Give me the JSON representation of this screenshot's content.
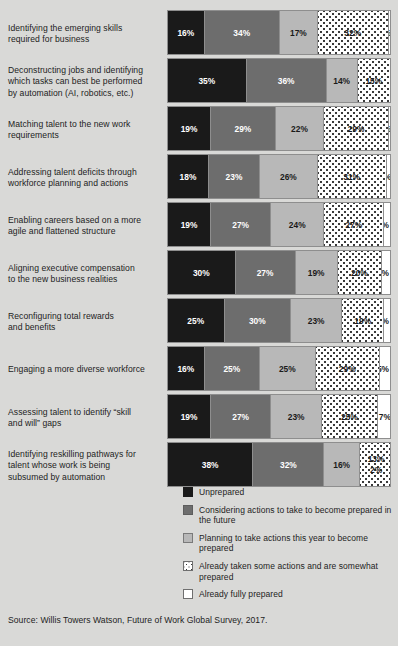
{
  "title": "",
  "source": "Source: Willis Towers Watson, Future of Work Global Survey, 2017.",
  "legend": {
    "items": [
      {
        "key": "unprepared",
        "label": "Unprepared"
      },
      {
        "key": "considering",
        "label": "Considering actions to take to become prepared in the future"
      },
      {
        "key": "planning",
        "label": "Planning to take actions this year to become prepared"
      },
      {
        "key": "taken",
        "label": "Already taken some actions and are somewhat prepared"
      },
      {
        "key": "fully",
        "label": "Already fully prepared"
      }
    ]
  },
  "chart_data": {
    "type": "bar",
    "orientation": "horizontal",
    "stacked": true,
    "unit": "%",
    "xlim": [
      0,
      100
    ],
    "grid": false,
    "legend_position": "bottom-right",
    "title": "",
    "xlabel": "",
    "ylabel": "",
    "series": [
      {
        "name": "Unprepared",
        "key": "unprepared",
        "color": "#1a1a1a",
        "values": [
          16,
          35,
          19,
          18,
          19,
          30,
          25,
          16,
          19,
          38
        ]
      },
      {
        "name": "Considering actions to take to become prepared in the future",
        "key": "considering",
        "color": "#6d6d6d",
        "values": [
          34,
          36,
          29,
          23,
          27,
          27,
          30,
          25,
          27,
          32
        ]
      },
      {
        "name": "Planning to take actions this year to become prepared",
        "key": "planning",
        "color": "#b8b8b8",
        "values": [
          17,
          14,
          22,
          26,
          24,
          19,
          23,
          25,
          23,
          16
        ]
      },
      {
        "name": "Already taken some actions and are somewhat prepared",
        "key": "taken",
        "color": "#ffffff",
        "pattern": "dots",
        "values": [
          32,
          15,
          29,
          31,
          27,
          20,
          19,
          29,
          25,
          13
        ]
      },
      {
        "name": "Already fully prepared",
        "key": "fully",
        "color": "#ffffff",
        "values": [
          2,
          0,
          2,
          3,
          3,
          4,
          3,
          5,
          7,
          2
        ]
      }
    ],
    "categories": [
      "Identifying the emerging skills required for business",
      "Deconstructing jobs and identifying which tasks can best be performed by automation (AI, robotics, etc.)",
      "Matching talent to the new work requirements",
      "Addressing talent deficits through workforce planning and actions",
      "Enabling careers based on a more agile and flattened structure",
      "Aligning executive compensation to the new business realities",
      "Reconfiguring total rewards and benefits",
      "Engaging a more diverse workforce",
      "Assessing talent to identify \"skill and will\" gaps",
      "Identifying reskilling pathways for talent whose work is being subsumed by automation"
    ]
  },
  "rows": [
    {
      "label_lines": [
        "Identifying the emerging skills",
        "required for business"
      ],
      "segments": [
        {
          "key": "unprepared",
          "value": 16,
          "text": "16%"
        },
        {
          "key": "considering",
          "value": 34,
          "text": "34%"
        },
        {
          "key": "planning",
          "value": 17,
          "text": "17%"
        },
        {
          "key": "taken",
          "value": 32,
          "text": "32%"
        },
        {
          "key": "fully",
          "value": 2,
          "text": "2%"
        }
      ]
    },
    {
      "label_lines": [
        "Deconstructing jobs and identifying",
        "which tasks can best be performed",
        "by automation (AI, robotics, etc.)"
      ],
      "segments": [
        {
          "key": "unprepared",
          "value": 35,
          "text": "35%"
        },
        {
          "key": "considering",
          "value": 36,
          "text": "36%"
        },
        {
          "key": "planning",
          "value": 14,
          "text": "14%"
        },
        {
          "key": "taken",
          "value": 15,
          "text": "15%"
        },
        {
          "key": "fully",
          "value": 0,
          "text": ""
        }
      ]
    },
    {
      "label_lines": [
        "Matching talent to the new work",
        "requirements"
      ],
      "segments": [
        {
          "key": "unprepared",
          "value": 19,
          "text": "19%"
        },
        {
          "key": "considering",
          "value": 29,
          "text": "29%"
        },
        {
          "key": "planning",
          "value": 22,
          "text": "22%"
        },
        {
          "key": "taken",
          "value": 29,
          "text": "29%"
        },
        {
          "key": "fully",
          "value": 2,
          "text": "2%"
        }
      ]
    },
    {
      "label_lines": [
        "Addressing talent deficits through",
        "workforce planning and actions"
      ],
      "segments": [
        {
          "key": "unprepared",
          "value": 18,
          "text": "18%"
        },
        {
          "key": "considering",
          "value": 23,
          "text": "23%"
        },
        {
          "key": "planning",
          "value": 26,
          "text": "26%"
        },
        {
          "key": "taken",
          "value": 31,
          "text": "31%"
        },
        {
          "key": "fully",
          "value": 3,
          "text": "3%"
        }
      ]
    },
    {
      "label_lines": [
        "Enabling careers based on a more",
        "agile and flattened structure"
      ],
      "segments": [
        {
          "key": "unprepared",
          "value": 19,
          "text": "19%"
        },
        {
          "key": "considering",
          "value": 27,
          "text": "27%"
        },
        {
          "key": "planning",
          "value": 24,
          "text": "24%"
        },
        {
          "key": "taken",
          "value": 27,
          "text": "27%"
        },
        {
          "key": "fully",
          "value": 3,
          "text": "3%"
        }
      ]
    },
    {
      "label_lines": [
        "Aligning executive compensation",
        "to the new business realities"
      ],
      "segments": [
        {
          "key": "unprepared",
          "value": 30,
          "text": "30%"
        },
        {
          "key": "considering",
          "value": 27,
          "text": "27%"
        },
        {
          "key": "planning",
          "value": 19,
          "text": "19%"
        },
        {
          "key": "taken",
          "value": 20,
          "text": "20%"
        },
        {
          "key": "fully",
          "value": 4,
          "text": "4%"
        }
      ]
    },
    {
      "label_lines": [
        "Reconfiguring total rewards",
        "and benefits"
      ],
      "segments": [
        {
          "key": "unprepared",
          "value": 25,
          "text": "25%"
        },
        {
          "key": "considering",
          "value": 30,
          "text": "30%"
        },
        {
          "key": "planning",
          "value": 23,
          "text": "23%"
        },
        {
          "key": "taken",
          "value": 19,
          "text": "19%"
        },
        {
          "key": "fully",
          "value": 3,
          "text": "3%"
        }
      ]
    },
    {
      "label_lines": [
        "Engaging a more diverse workforce"
      ],
      "segments": [
        {
          "key": "unprepared",
          "value": 16,
          "text": "16%"
        },
        {
          "key": "considering",
          "value": 25,
          "text": "25%"
        },
        {
          "key": "planning",
          "value": 25,
          "text": "25%"
        },
        {
          "key": "taken",
          "value": 29,
          "text": "29%"
        },
        {
          "key": "fully",
          "value": 5,
          "text": "5%"
        }
      ]
    },
    {
      "label_lines": [
        "Assessing talent to identify “skill",
        "and will” gaps"
      ],
      "segments": [
        {
          "key": "unprepared",
          "value": 19,
          "text": "19%"
        },
        {
          "key": "considering",
          "value": 27,
          "text": "27%"
        },
        {
          "key": "planning",
          "value": 23,
          "text": "23%"
        },
        {
          "key": "taken",
          "value": 25,
          "text": "25%"
        },
        {
          "key": "fully",
          "value": 7,
          "text": "7%"
        }
      ]
    },
    {
      "label_lines": [
        "Identifying reskilling pathways for",
        "talent whose work is being",
        "subsumed by automation"
      ],
      "segments": [
        {
          "key": "unprepared",
          "value": 38,
          "text": "38%"
        },
        {
          "key": "considering",
          "value": 32,
          "text": "32%"
        },
        {
          "key": "planning",
          "value": 16,
          "text": "16%"
        },
        {
          "key": "taken",
          "value": 13,
          "text": "13%",
          "stacked_with_next": true
        },
        {
          "key": "fully",
          "value": 2,
          "text": "2%"
        }
      ]
    }
  ]
}
